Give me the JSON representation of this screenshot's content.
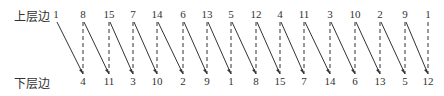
{
  "labels": {
    "top": "上层边",
    "bottom": "下层边"
  },
  "top_row": [
    1,
    8,
    15,
    7,
    14,
    6,
    13,
    5,
    12,
    4,
    11,
    3,
    10,
    2,
    9,
    1
  ],
  "bottom_row": [
    4,
    11,
    3,
    10,
    2,
    9,
    1,
    8,
    15,
    7,
    14,
    6,
    13,
    5,
    12
  ],
  "x_positions": [
    56,
    83,
    109,
    133,
    157,
    183,
    207,
    231,
    256,
    280,
    304,
    330,
    355,
    380,
    405,
    428
  ],
  "colors": {
    "line": "#333333",
    "text": "#333333"
  }
}
